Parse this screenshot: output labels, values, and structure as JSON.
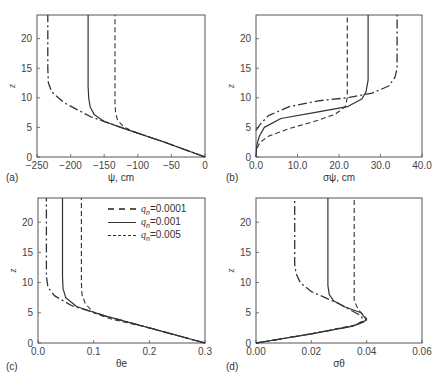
{
  "figure": {
    "legend": {
      "entries": [
        {
          "label": "q_n=0.0001",
          "text_var": "q",
          "text_sub": "n",
          "text_val": "=0.0001",
          "style": "dash-dot"
        },
        {
          "label": "q_n=0.001",
          "text_var": "q",
          "text_sub": "n",
          "text_val": "=0.001",
          "style": "solid"
        },
        {
          "label": "q_n=0.005",
          "text_var": "q",
          "text_sub": "n",
          "text_val": "=0.005",
          "style": "dashed"
        }
      ]
    }
  },
  "chart_data": [
    {
      "panel": "(a)",
      "type": "line",
      "xlabel": "ψ, cm",
      "ylabel": "z",
      "xlim": [
        -250,
        0
      ],
      "ylim": [
        0,
        24
      ],
      "xticks": [
        "-250",
        "-200",
        "-150",
        "-100",
        "-50",
        "0"
      ],
      "yticks": [
        "0",
        "5",
        "10",
        "15",
        "20"
      ],
      "series": [
        {
          "name": "q_n=0.0001",
          "style": "dash-dot",
          "points": [
            [
              0,
              0
            ],
            [
              -60,
              2.5
            ],
            [
              -120,
              4.8
            ],
            [
              -170,
              6.8
            ],
            [
              -210,
              9.2
            ],
            [
              -228,
              11
            ],
            [
              -233,
              12.5
            ],
            [
              -234,
              15
            ],
            [
              -234,
              24
            ]
          ]
        },
        {
          "name": "q_n=0.001",
          "style": "solid",
          "points": [
            [
              0,
              0
            ],
            [
              -60,
              2.5
            ],
            [
              -120,
              4.8
            ],
            [
              -150,
              6
            ],
            [
              -165,
              7.2
            ],
            [
              -171,
              8.5
            ],
            [
              -173,
              10
            ],
            [
              -174,
              12
            ],
            [
              -174,
              24
            ]
          ]
        },
        {
          "name": "q_n=0.005",
          "style": "dashed",
          "points": [
            [
              0,
              0
            ],
            [
              -60,
              2.5
            ],
            [
              -100,
              4
            ],
            [
              -120,
              5
            ],
            [
              -130,
              6.2
            ],
            [
              -133,
              7.5
            ],
            [
              -134,
              9
            ],
            [
              -134,
              24
            ]
          ]
        }
      ]
    },
    {
      "panel": "(b)",
      "type": "line",
      "xlabel": "σψ, cm",
      "ylabel": "z",
      "xlim": [
        0,
        40
      ],
      "ylim": [
        0,
        24
      ],
      "xticks": [
        "0.0",
        "10.0",
        "20.0",
        "30.0",
        "40.0"
      ],
      "yticks": [
        "0",
        "5",
        "10",
        "15",
        "20"
      ],
      "series": [
        {
          "name": "q_n=0.0001",
          "style": "dash-dot",
          "points": [
            [
              0,
              4.5
            ],
            [
              1,
              5.5
            ],
            [
              3,
              7
            ],
            [
              8,
              8.5
            ],
            [
              15,
              9.5
            ],
            [
              22,
              10
            ],
            [
              28,
              10.8
            ],
            [
              32,
              12
            ],
            [
              33.5,
              13.5
            ],
            [
              34,
              15
            ],
            [
              34,
              24
            ]
          ]
        },
        {
          "name": "q_n=0.001",
          "style": "solid",
          "points": [
            [
              0,
              0
            ],
            [
              0.2,
              2
            ],
            [
              0.8,
              3.5
            ],
            [
              2,
              5
            ],
            [
              6,
              6.5
            ],
            [
              14,
              7.5
            ],
            [
              22,
              8.5
            ],
            [
              25.5,
              9.8
            ],
            [
              26.5,
              11
            ],
            [
              27,
              13
            ],
            [
              27,
              24
            ]
          ]
        },
        {
          "name": "q_n=0.005",
          "style": "dashed",
          "points": [
            [
              0.3,
              1.5
            ],
            [
              1,
              2.5
            ],
            [
              3,
              3.5
            ],
            [
              8,
              4.8
            ],
            [
              14,
              6
            ],
            [
              19,
              7.2
            ],
            [
              21.5,
              8.5
            ],
            [
              22,
              10
            ],
            [
              22,
              24
            ]
          ]
        }
      ]
    },
    {
      "panel": "(c)",
      "type": "line",
      "xlabel": "θe",
      "ylabel": "z",
      "xlim": [
        0,
        0.3
      ],
      "ylim": [
        0,
        24
      ],
      "xticks": [
        "0.0",
        "0.1",
        "0.2",
        "0.3"
      ],
      "yticks": [
        "0",
        "5",
        "10",
        "15",
        "20"
      ],
      "series": [
        {
          "name": "q_n=0.0001",
          "style": "dash-dot",
          "points": [
            [
              0.3,
              0
            ],
            [
              0.2,
              2.5
            ],
            [
              0.12,
              4.5
            ],
            [
              0.06,
              6.2
            ],
            [
              0.03,
              7.8
            ],
            [
              0.018,
              9.2
            ],
            [
              0.015,
              11
            ],
            [
              0.015,
              24
            ]
          ]
        },
        {
          "name": "q_n=0.001",
          "style": "solid",
          "points": [
            [
              0.3,
              0
            ],
            [
              0.2,
              2.5
            ],
            [
              0.12,
              4.5
            ],
            [
              0.07,
              6
            ],
            [
              0.05,
              7.5
            ],
            [
              0.045,
              9
            ],
            [
              0.044,
              11
            ],
            [
              0.044,
              24
            ]
          ]
        },
        {
          "name": "q_n=0.005",
          "style": "dashed",
          "points": [
            [
              0.3,
              0
            ],
            [
              0.2,
              2.5
            ],
            [
              0.13,
              4
            ],
            [
              0.1,
              5
            ],
            [
              0.085,
              6.5
            ],
            [
              0.079,
              8
            ],
            [
              0.078,
              10
            ],
            [
              0.078,
              24
            ]
          ]
        }
      ]
    },
    {
      "panel": "(d)",
      "type": "line",
      "xlabel": "σθ",
      "ylabel": "z",
      "xlim": [
        0,
        0.06
      ],
      "ylim": [
        0,
        24
      ],
      "xticks": [
        "0.00",
        "0.02",
        "0.04",
        "0.06"
      ],
      "yticks": [
        "0",
        "5",
        "10",
        "15",
        "20"
      ],
      "series": [
        {
          "name": "q_n=0.0001",
          "style": "dash-dot",
          "points": [
            [
              0,
              0
            ],
            [
              0.02,
              1.5
            ],
            [
              0.035,
              2.8
            ],
            [
              0.039,
              3.5
            ],
            [
              0.038,
              4.5
            ],
            [
              0.03,
              6.5
            ],
            [
              0.02,
              8.5
            ],
            [
              0.016,
              10
            ],
            [
              0.0145,
              11.5
            ],
            [
              0.014,
              13
            ],
            [
              0.014,
              24
            ]
          ]
        },
        {
          "name": "q_n=0.001",
          "style": "solid",
          "points": [
            [
              0,
              0
            ],
            [
              0.02,
              1.5
            ],
            [
              0.035,
              2.8
            ],
            [
              0.04,
              3.8
            ],
            [
              0.038,
              5
            ],
            [
              0.032,
              6
            ],
            [
              0.028,
              7
            ],
            [
              0.0265,
              8
            ],
            [
              0.026,
              9.5
            ],
            [
              0.026,
              24
            ]
          ]
        },
        {
          "name": "q_n=0.005",
          "style": "dashed",
          "points": [
            [
              0,
              0
            ],
            [
              0.02,
              1.5
            ],
            [
              0.036,
              3
            ],
            [
              0.04,
              4
            ],
            [
              0.037,
              5.5
            ],
            [
              0.0355,
              7
            ],
            [
              0.0355,
              24
            ]
          ]
        }
      ]
    }
  ]
}
